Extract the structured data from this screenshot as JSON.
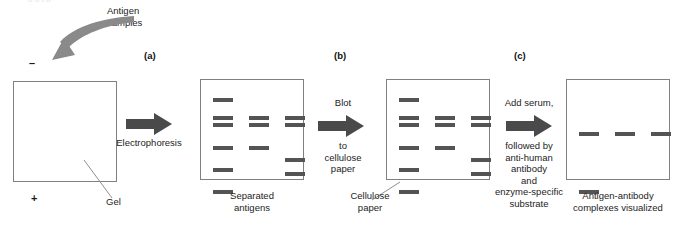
{
  "figure": {
    "top_artifact": "o      o  t                              o"
  },
  "colors": {
    "band": "#545454",
    "arrow": "#4a4a4a",
    "curved_arrow": "#8a8a8a",
    "plate_border": "#808080",
    "leader_line": "#8f8f8f",
    "text": "#1d1d1d"
  },
  "annotations": {
    "antigen_samples": "Antigen\nsamples",
    "negative_pole": "–",
    "positive_pole": "+",
    "gel_label": "Gel"
  },
  "panels": [
    {
      "id": "a",
      "label": "(a)",
      "caption": "Separated\nantigens",
      "plate_name": "gel-plate"
    },
    {
      "id": "b",
      "label": "(b)",
      "caption": "Cellulose\npaper",
      "plate_name": "cellulose-paper-plate"
    },
    {
      "id": "c",
      "label": "(c)",
      "caption": "Antigen-antibody\ncomplexes visualized",
      "plate_name": "visualized-plate"
    }
  ],
  "steps": [
    {
      "id": "electrophoresis",
      "above": "",
      "below": "Electrophoresis"
    },
    {
      "id": "blot",
      "above": "Blot",
      "below": "to\ncellulose\npaper"
    },
    {
      "id": "add-serum",
      "above": "Add serum,",
      "below": "followed by\nanti-human\nantibody\nand\nenzyme-specific\nsubstrate"
    }
  ],
  "gel_blank": {
    "name": "empty-gel",
    "bands": []
  },
  "separated_antigens": {
    "name": "separated-antigens-bands",
    "lanes": [
      {
        "lane": 1,
        "x": 12,
        "bands": [
          18,
          36,
          43,
          66,
          88,
          110
        ]
      },
      {
        "lane": 2,
        "x": 48,
        "bands": [
          36,
          43,
          66
        ]
      },
      {
        "lane": 3,
        "x": 84,
        "bands": [
          36,
          43,
          78,
          92
        ]
      }
    ]
  },
  "cellulose_paper": {
    "name": "cellulose-paper-bands",
    "lanes": [
      {
        "lane": 1,
        "x": 12,
        "bands": [
          18,
          36,
          43,
          66,
          88,
          110
        ]
      },
      {
        "lane": 2,
        "x": 48,
        "bands": [
          36,
          43,
          66
        ]
      },
      {
        "lane": 3,
        "x": 84,
        "bands": [
          36,
          43,
          78,
          92
        ]
      }
    ]
  },
  "visualized": {
    "name": "visualized-bands",
    "lanes": [
      {
        "lane": 1,
        "x": 12,
        "bands": [
          52,
          110
        ]
      },
      {
        "lane": 2,
        "x": 48,
        "bands": [
          52
        ]
      },
      {
        "lane": 3,
        "x": 84,
        "bands": [
          52
        ]
      }
    ]
  }
}
